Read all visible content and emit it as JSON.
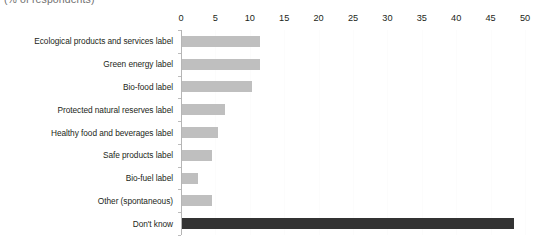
{
  "title_fragment": "(% of respondents)",
  "chart_data": {
    "type": "bar",
    "orientation": "horizontal",
    "title": "",
    "xlabel": "",
    "ylabel": "",
    "xlim": [
      0,
      50
    ],
    "xticks": [
      0,
      5,
      10,
      15,
      20,
      25,
      30,
      35,
      40,
      45,
      50
    ],
    "grid": true,
    "legend": "none",
    "categories": [
      "Ecological products and services label",
      "Green energy label",
      "Bio-food label",
      "Protected natural reserves label",
      "Healthy food and beverages label",
      "Safe products label",
      "Bio-fuel label",
      "Other (spontaneous)",
      "Don't know"
    ],
    "values": [
      11.3,
      11.3,
      10.2,
      6.3,
      5.2,
      4.4,
      2.3,
      4.4,
      48.3
    ],
    "bar_colors": [
      "#bfbfbf",
      "#bfbfbf",
      "#bfbfbf",
      "#bfbfbf",
      "#bfbfbf",
      "#bfbfbf",
      "#bfbfbf",
      "#bfbfbf",
      "#333333"
    ]
  },
  "colors": {
    "bar_default": "#bfbfbf",
    "bar_highlight": "#333333",
    "axis": "#b5b5b5",
    "text": "#231f20",
    "background": "#ffffff"
  }
}
